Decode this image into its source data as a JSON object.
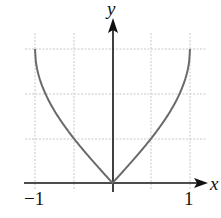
{
  "chart_data": {
    "type": "line",
    "title": "",
    "xlabel": "x",
    "ylabel": "y",
    "xlim": [
      -1,
      1
    ],
    "ylim": [
      0,
      1.5708
    ],
    "grid": true,
    "x_ticks": [
      -1,
      -0.5,
      0,
      0.5,
      1
    ],
    "x_tick_labels": [
      "−1",
      "1"
    ],
    "y_grid": [
      0.5236,
      1.0472,
      1.5708
    ],
    "series": [
      {
        "name": "y = arcsin|x|",
        "x": [
          -1,
          -0.9,
          -0.75,
          -0.5,
          -0.25,
          0,
          0.25,
          0.5,
          0.75,
          0.9,
          1
        ],
        "values": [
          1.5708,
          1.1198,
          0.8481,
          0.5236,
          0.2527,
          0,
          0.2527,
          0.5236,
          0.8481,
          1.1198,
          1.5708
        ]
      }
    ],
    "colors": {
      "curve": "#6a6a6a",
      "axis": "#111111",
      "grid": "#c8c8c8"
    }
  },
  "labels": {
    "x_axis": "x",
    "y_axis": "y",
    "x_min": "−1",
    "x_max": "1"
  }
}
